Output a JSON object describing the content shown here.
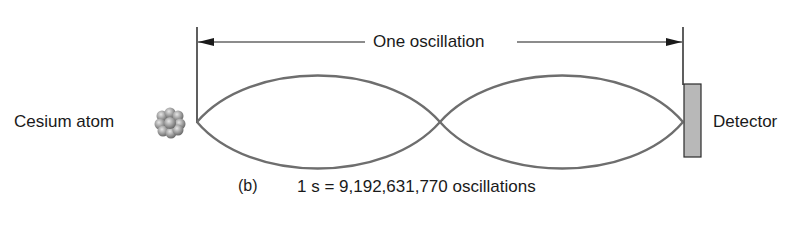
{
  "diagram": {
    "measure_label": "One oscillation",
    "source_label": "Cesium atom",
    "detector_label": "Detector",
    "caption": {
      "part": "(b)",
      "equation": "1 s = 9,192,631,770 oscillations"
    },
    "colors": {
      "wave": "#6e6e6e",
      "line": "#1a1a1a",
      "detector_fill": "#b8b8b8",
      "atom": "#9a9a9a"
    }
  }
}
